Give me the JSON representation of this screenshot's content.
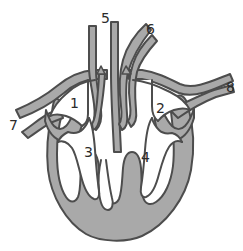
{
  "figure": {
    "type": "anatomical-line-diagram",
    "background_color": "#ffffff",
    "tissue_fill_color": "#a9a9a9",
    "outline_color": "#4d4d4d",
    "chamber_fill_color": "#ffffff",
    "label_color": "#2b2b2b",
    "canvas": {
      "width": 243,
      "height": 251
    }
  },
  "labels": [
    {
      "id": "label-1",
      "text": "1",
      "x": 70,
      "y": 96,
      "leader": false
    },
    {
      "id": "label-2",
      "text": "2",
      "x": 156,
      "y": 101,
      "leader": false
    },
    {
      "id": "label-3",
      "text": "3",
      "x": 84,
      "y": 145,
      "leader": false
    },
    {
      "id": "label-4",
      "text": "4",
      "x": 141,
      "y": 150,
      "leader": false
    },
    {
      "id": "label-5",
      "text": "5",
      "x": 101,
      "y": 11,
      "leader": false
    },
    {
      "id": "label-6",
      "text": "6",
      "x": 146,
      "y": 22,
      "leader": false
    },
    {
      "id": "label-7",
      "text": "7",
      "x": 9,
      "y": 118,
      "leader": false
    },
    {
      "id": "label-8",
      "text": "8",
      "x": 226,
      "y": 80,
      "leader": false
    }
  ],
  "structures": [
    {
      "name": "left-atrium-chamber",
      "label_ref": "1"
    },
    {
      "name": "right-atrium-chamber",
      "label_ref": "2"
    },
    {
      "name": "left-ventricle-chamber",
      "label_ref": "3"
    },
    {
      "name": "right-ventricle-chamber",
      "label_ref": "4"
    },
    {
      "name": "ascending-vessel-center",
      "label_ref": "5"
    },
    {
      "name": "upper-right-vessel",
      "label_ref": "6"
    },
    {
      "name": "left-lateral-vessel",
      "label_ref": "7"
    },
    {
      "name": "right-lateral-vessel",
      "label_ref": "8"
    }
  ]
}
